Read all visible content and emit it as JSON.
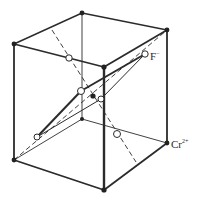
{
  "diagram": {
    "labels": {
      "anion": {
        "symbol": "F",
        "charge": "−"
      },
      "cation": {
        "symbol": "Cr",
        "charge": "2+"
      }
    },
    "colors": {
      "edge": "#2b2b2b",
      "atom_fill_cation": "#222222",
      "atom_fill_anion": "#ffffff",
      "background": "#ffffff"
    },
    "vertices": {
      "top_back": [
        82,
        13
      ],
      "top_left": [
        14,
        44
      ],
      "top_right": [
        167,
        30
      ],
      "top_front": [
        104,
        67
      ],
      "bottom_left": [
        14,
        160
      ],
      "bottom_front": [
        104,
        190
      ],
      "bottom_right": [
        167,
        143
      ],
      "bottom_back": [
        82,
        119
      ]
    },
    "center_cation": [
      93,
      96
    ],
    "anions": [
      [
        69,
        58
      ],
      [
        145,
        54
      ],
      [
        81,
        91
      ],
      [
        101,
        99
      ],
      [
        37,
        137
      ],
      [
        117,
        134
      ]
    ]
  }
}
